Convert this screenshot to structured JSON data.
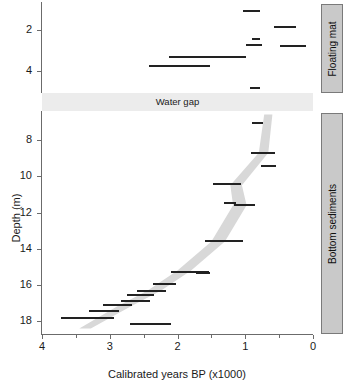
{
  "title": "Rano Kao - Core 1",
  "subtitle": "(Horrocks et al., 2013)",
  "axes": {
    "ylabel": "Depth (m)",
    "xlabel": "Calibrated years BP (x1000)",
    "x_ticks": [
      "4",
      "3",
      "2",
      "1",
      "0"
    ],
    "y_ticks_upper": [
      "2",
      "4"
    ],
    "y_ticks_lower": [
      "8",
      "10",
      "12",
      "14",
      "16",
      "18"
    ]
  },
  "water_gap": {
    "label": "Water gap"
  },
  "facies": [
    {
      "name": "floating-mat",
      "label": "Floating mat"
    },
    {
      "name": "bottom-sediments",
      "label": "Bottom sediments"
    }
  ],
  "colors": {
    "bar": "#222222",
    "envelope": "#d8d8d8",
    "facies_fill": "#c9c9c9",
    "facies_stroke": "#7a7a7a",
    "water_gap": "#ececec",
    "axis": "#6b6b6b"
  },
  "chart_data": {
    "type": "scatter",
    "title": "Rano Kao - Core 1",
    "subtitle": "(Horrocks et al., 2013)",
    "xlabel": "Calibrated years BP (x1000)",
    "ylabel": "Depth (m)",
    "xlim": [
      4,
      0
    ],
    "x_ticks": [
      4,
      3,
      2,
      1,
      0
    ],
    "x_minor_ticks": [
      3.5,
      2.5,
      1.5,
      0.5
    ],
    "grid": false,
    "legend": null,
    "panels": [
      {
        "name": "floating-mat",
        "facies_label": "Floating mat",
        "ylim": [
          0.6,
          5.1
        ],
        "y_ticks": [
          2,
          4
        ],
        "note": "Calibrated radiocarbon age ranges (horizontal bars) vs core depth",
        "points": [
          {
            "depth": 1.05,
            "age_from": 1.04,
            "age_to": 0.78
          },
          {
            "depth": 1.85,
            "age_from": 0.58,
            "age_to": 0.25
          },
          {
            "depth": 2.45,
            "age_from": 0.9,
            "age_to": 0.78
          },
          {
            "depth": 2.7,
            "age_from": 0.99,
            "age_to": 0.75
          },
          {
            "depth": 2.78,
            "age_from": 0.48,
            "age_to": 0.11
          },
          {
            "depth": 3.32,
            "age_from": 2.12,
            "age_to": 0.99
          },
          {
            "depth": 3.75,
            "age_from": 2.42,
            "age_to": 1.52
          },
          {
            "depth": 4.85,
            "age_from": 0.93,
            "age_to": 0.78
          }
        ]
      },
      {
        "name": "bottom-sediments",
        "facies_label": "Bottom sediments",
        "ylim": [
          6.4,
          18.7
        ],
        "y_ticks": [
          8,
          10,
          12,
          14,
          16,
          18
        ],
        "note": "Calibrated radiocarbon age ranges (horizontal bars) with grey age-depth model envelope",
        "points": [
          {
            "depth": 7.05,
            "age_from": 0.9,
            "age_to": 0.74
          },
          {
            "depth": 8.7,
            "age_from": 0.92,
            "age_to": 0.56
          },
          {
            "depth": 9.45,
            "age_from": 0.77,
            "age_to": 0.55
          },
          {
            "depth": 10.45,
            "age_from": 1.48,
            "age_to": 1.06
          },
          {
            "depth": 11.45,
            "age_from": 1.32,
            "age_to": 1.13
          },
          {
            "depth": 11.6,
            "age_from": 1.17,
            "age_to": 0.85
          },
          {
            "depth": 13.55,
            "age_from": 1.6,
            "age_to": 1.03
          },
          {
            "depth": 15.25,
            "age_from": 2.1,
            "age_to": 1.53
          },
          {
            "depth": 15.35,
            "age_from": 1.73,
            "age_to": 1.52
          },
          {
            "depth": 15.95,
            "age_from": 2.36,
            "age_to": 2.03
          },
          {
            "depth": 16.3,
            "age_from": 2.6,
            "age_to": 2.17
          },
          {
            "depth": 16.55,
            "age_from": 2.74,
            "age_to": 2.35
          },
          {
            "depth": 16.85,
            "age_from": 2.83,
            "age_to": 2.4
          },
          {
            "depth": 17.1,
            "age_from": 3.1,
            "age_to": 2.67
          },
          {
            "depth": 17.45,
            "age_from": 3.3,
            "age_to": 2.87
          },
          {
            "depth": 17.8,
            "age_from": 3.72,
            "age_to": 2.93
          },
          {
            "depth": 18.15,
            "age_from": 2.7,
            "age_to": 2.1
          }
        ],
        "envelope": {
          "description": "grey 95% age-depth model band",
          "upper": [
            {
              "depth": 6.6,
              "age": 0.72
            },
            {
              "depth": 8.7,
              "age": 0.8
            },
            {
              "depth": 10.5,
              "age": 1.22
            },
            {
              "depth": 11.6,
              "age": 1.18
            },
            {
              "depth": 13.6,
              "age": 1.5
            },
            {
              "depth": 15.2,
              "age": 2.0
            },
            {
              "depth": 16.3,
              "age": 2.44
            },
            {
              "depth": 17.2,
              "age": 2.9
            },
            {
              "depth": 18.4,
              "age": 3.45
            }
          ],
          "lower": [
            {
              "depth": 6.6,
              "age": 0.6
            },
            {
              "depth": 8.7,
              "age": 0.66
            },
            {
              "depth": 10.5,
              "age": 1.05
            },
            {
              "depth": 11.6,
              "age": 0.98
            },
            {
              "depth": 13.6,
              "age": 1.3
            },
            {
              "depth": 15.2,
              "age": 1.8
            },
            {
              "depth": 16.3,
              "age": 2.24
            },
            {
              "depth": 17.2,
              "age": 2.7
            },
            {
              "depth": 18.4,
              "age": 3.28
            }
          ]
        }
      }
    ]
  }
}
